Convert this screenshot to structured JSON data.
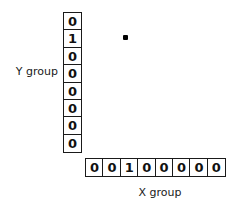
{
  "figure": {
    "background_color": "#ffffff",
    "line_color": "#1a1a1a",
    "y_group": {
      "label": "Y group",
      "orientation": "vertical",
      "cells": [
        "0",
        "1",
        "0",
        "0",
        "0",
        "0",
        "0",
        "0"
      ]
    },
    "x_group": {
      "label": "X group",
      "orientation": "horizontal",
      "cells": [
        "0",
        "0",
        "1",
        "0",
        "0",
        "0",
        "0",
        "0"
      ]
    },
    "marker": {
      "name": "dot-marker",
      "shape": "filled-square",
      "color": "#000000"
    }
  }
}
